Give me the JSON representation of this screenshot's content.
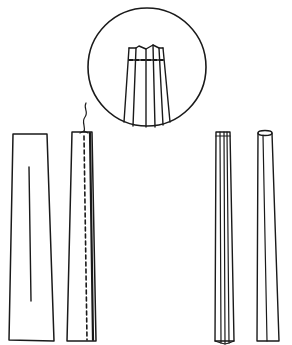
{
  "diagram": {
    "type": "technical-illustration",
    "colors": {
      "background": "#ffffff",
      "ink": "#1a1a1a"
    },
    "panels": [
      {
        "id": "flat-strip",
        "description": "Tapered flat fabric strip with center mark line"
      },
      {
        "id": "stitched-strip",
        "description": "Strip stitched with dashed line, thread end at top"
      },
      {
        "id": "detail-circle",
        "description": "Magnified detail of pleated top with dashed stitch line"
      },
      {
        "id": "pleated-strip",
        "description": "Strip folded into narrow pleats"
      },
      {
        "id": "finished-tube",
        "description": "Finished tapered tube with rounded top opening"
      }
    ],
    "labels": []
  }
}
